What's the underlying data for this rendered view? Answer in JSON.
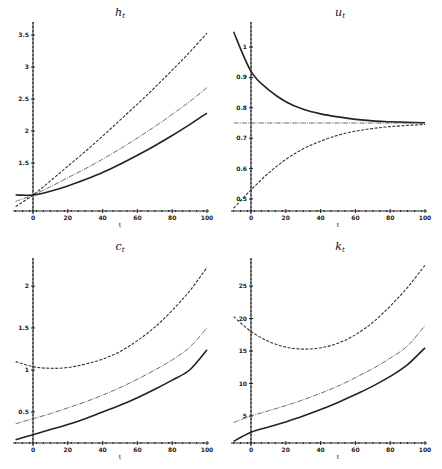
{
  "chart_data": [
    {
      "type": "line",
      "title": "h_t",
      "title_main": "h",
      "title_sub": "t",
      "xlabel": "t",
      "ylabel": "",
      "x_ticks": [
        0,
        20,
        40,
        60,
        80,
        100
      ],
      "y_ticks": [
        1.5,
        2,
        2.5,
        3,
        3.5
      ],
      "y_tick_labels": [
        "1.5",
        "2",
        "2.5",
        "3",
        "3.5"
      ],
      "xlim": [
        -10,
        100
      ],
      "ylim": [
        0.8,
        3.6
      ],
      "grid": false,
      "x": [
        -10,
        0,
        10,
        20,
        30,
        40,
        50,
        60,
        70,
        80,
        90,
        100
      ],
      "series": [
        {
          "name": "dashed",
          "style": "dashed",
          "values": [
            0.82,
            1.0,
            1.22,
            1.45,
            1.68,
            1.92,
            2.17,
            2.42,
            2.68,
            2.95,
            3.23,
            3.53
          ]
        },
        {
          "name": "dash-dot",
          "style": "dashdot",
          "values": [
            0.9,
            1.0,
            1.13,
            1.27,
            1.41,
            1.56,
            1.72,
            1.89,
            2.07,
            2.26,
            2.46,
            2.68
          ]
        },
        {
          "name": "solid",
          "style": "solid",
          "values": [
            1.0,
            1.0,
            1.06,
            1.14,
            1.24,
            1.35,
            1.48,
            1.62,
            1.77,
            1.93,
            2.1,
            2.28
          ]
        }
      ]
    },
    {
      "type": "line",
      "title": "u_t",
      "title_main": "u",
      "title_sub": "t",
      "xlabel": "t",
      "ylabel": "",
      "x_ticks": [
        0,
        20,
        40,
        60,
        80,
        100
      ],
      "y_ticks": [
        0.5,
        0.6,
        0.7,
        0.8,
        0.9,
        1
      ],
      "y_tick_labels": [
        "0.5",
        "0.6",
        "0.7",
        "0.8",
        "0.9",
        "1"
      ],
      "xlim": [
        -10,
        100
      ],
      "ylim": [
        0.46,
        1.05
      ],
      "grid": false,
      "x": [
        -10,
        0,
        10,
        20,
        30,
        40,
        50,
        60,
        70,
        80,
        90,
        100
      ],
      "series": [
        {
          "name": "solid",
          "style": "solid",
          "values": [
            1.05,
            0.92,
            0.86,
            0.82,
            0.795,
            0.78,
            0.77,
            0.762,
            0.757,
            0.754,
            0.752,
            0.751
          ]
        },
        {
          "name": "dash-dot",
          "style": "dashdot",
          "values": [
            0.75,
            0.75,
            0.75,
            0.75,
            0.75,
            0.75,
            0.75,
            0.75,
            0.75,
            0.75,
            0.75,
            0.75
          ]
        },
        {
          "name": "dashed",
          "style": "dashed",
          "values": [
            0.47,
            0.53,
            0.585,
            0.63,
            0.665,
            0.69,
            0.71,
            0.723,
            0.732,
            0.738,
            0.742,
            0.745
          ]
        }
      ]
    },
    {
      "type": "line",
      "title": "c_t",
      "title_main": "c",
      "title_sub": "t",
      "xlabel": "t",
      "ylabel": "",
      "x_ticks": [
        0,
        20,
        40,
        60,
        80,
        100
      ],
      "y_ticks": [
        0.5,
        1,
        1.5,
        2
      ],
      "y_tick_labels": [
        "0.5",
        "1",
        "1.5",
        "2"
      ],
      "xlim": [
        -10,
        100
      ],
      "ylim": [
        0.13,
        2.23
      ],
      "grid": false,
      "x": [
        -10,
        0,
        10,
        20,
        30,
        40,
        50,
        60,
        70,
        80,
        90,
        100
      ],
      "series": [
        {
          "name": "dashed",
          "style": "dashed",
          "values": [
            1.1,
            1.04,
            1.02,
            1.03,
            1.07,
            1.13,
            1.22,
            1.35,
            1.51,
            1.71,
            1.94,
            2.22
          ]
        },
        {
          "name": "dash-dot",
          "style": "dashdot",
          "values": [
            0.36,
            0.42,
            0.48,
            0.55,
            0.62,
            0.7,
            0.79,
            0.89,
            1.0,
            1.12,
            1.27,
            1.5
          ]
        },
        {
          "name": "solid",
          "style": "solid",
          "values": [
            0.17,
            0.23,
            0.29,
            0.35,
            0.42,
            0.5,
            0.58,
            0.67,
            0.77,
            0.88,
            1.0,
            1.24
          ]
        }
      ]
    },
    {
      "type": "line",
      "title": "k_t",
      "title_main": "k",
      "title_sub": "t",
      "xlabel": "t",
      "ylabel": "",
      "x_ticks": [
        0,
        20,
        40,
        60,
        80,
        100
      ],
      "y_ticks": [
        5,
        10,
        15,
        20,
        25
      ],
      "y_tick_labels": [
        "5",
        "10",
        "15",
        "20",
        "25"
      ],
      "xlim": [
        -10,
        100
      ],
      "ylim": [
        0.7,
        29
      ],
      "grid": false,
      "x": [
        -10,
        0,
        10,
        20,
        30,
        40,
        50,
        60,
        70,
        80,
        90,
        100
      ],
      "series": [
        {
          "name": "dashed",
          "style": "dashed",
          "values": [
            20.3,
            18.0,
            16.5,
            15.6,
            15.3,
            15.5,
            16.2,
            17.5,
            19.4,
            21.9,
            24.8,
            28.2
          ]
        },
        {
          "name": "dash-dot",
          "style": "dashdot",
          "values": [
            4.0,
            5.0,
            5.8,
            6.6,
            7.5,
            8.5,
            9.6,
            10.9,
            12.3,
            13.9,
            15.8,
            18.9
          ]
        },
        {
          "name": "solid",
          "style": "solid",
          "values": [
            1.1,
            2.5,
            3.3,
            4.1,
            5.0,
            6.0,
            7.1,
            8.3,
            9.6,
            11.1,
            12.9,
            15.5
          ]
        }
      ]
    }
  ]
}
